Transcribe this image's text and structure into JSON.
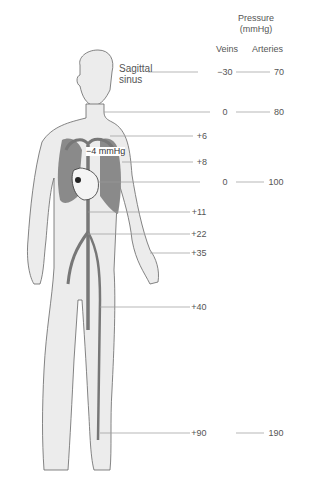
{
  "header": {
    "title_line1": "Pressure",
    "title_line2": "(mmHg)",
    "veins_label": "Veins",
    "arteries_label": "Arteries"
  },
  "annotations": {
    "sagittal_sinus_line1": "Sagittal",
    "sagittal_sinus_line2": "sinus",
    "intrathoracic": "−4 mmHg"
  },
  "rows": [
    {
      "site": "sagittal sinus",
      "vein": "−30",
      "artery": "70"
    },
    {
      "site": "neck (jugular)",
      "vein": "0",
      "artery": "80"
    },
    {
      "site": "subclavian",
      "vein": "+6",
      "artery": ""
    },
    {
      "site": "arm (upper)",
      "vein": "+8",
      "artery": ""
    },
    {
      "site": "heart (right atrium)",
      "vein": "0",
      "artery": "100"
    },
    {
      "site": "inferior vena cava",
      "vein": "+11",
      "artery": ""
    },
    {
      "site": "iliac",
      "vein": "+22",
      "artery": ""
    },
    {
      "site": "wrist",
      "vein": "+35",
      "artery": ""
    },
    {
      "site": "thigh",
      "vein": "+40",
      "artery": ""
    },
    {
      "site": "ankle",
      "vein": "+90",
      "artery": "190"
    }
  ],
  "colors": {
    "body_fill": "#ececec",
    "outline": "#555555",
    "vessel": "#7a7a7a",
    "lung": "#8a8a8a",
    "leader": "#9a9a9a"
  }
}
